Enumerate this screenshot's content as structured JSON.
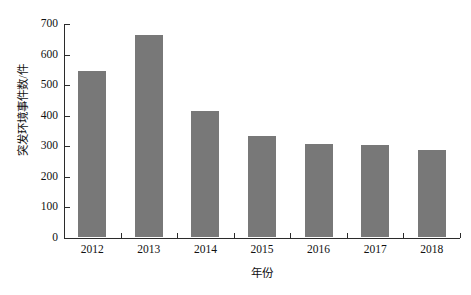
{
  "chart_data": {
    "type": "bar",
    "title": "",
    "subtitle": "",
    "xlabel": "年份",
    "ylabel": "突发环境事件数/件",
    "categories": [
      "2012",
      "2013",
      "2014",
      "2015",
      "2016",
      "2017",
      "2018"
    ],
    "values": [
      542,
      660,
      413,
      330,
      303,
      300,
      283
    ],
    "series": [
      {
        "name": "突发环境事件数",
        "values": [
          542,
          660,
          413,
          330,
          303,
          300,
          283
        ]
      }
    ],
    "ylim": [
      0,
      700
    ],
    "ytick_labels": [
      "0",
      "100",
      "200",
      "300",
      "400",
      "500",
      "600",
      "700"
    ],
    "ytick_values": [
      0,
      100,
      200,
      300,
      400,
      500,
      600,
      700
    ],
    "grid": false,
    "legend": null,
    "legend_position": "none",
    "bar_color": "#787878",
    "axis_color": "#2b2b2b",
    "background_color": "#ffffff"
  },
  "axes": {
    "y_title": "突发环境事件数/件",
    "x_title": "年份"
  }
}
